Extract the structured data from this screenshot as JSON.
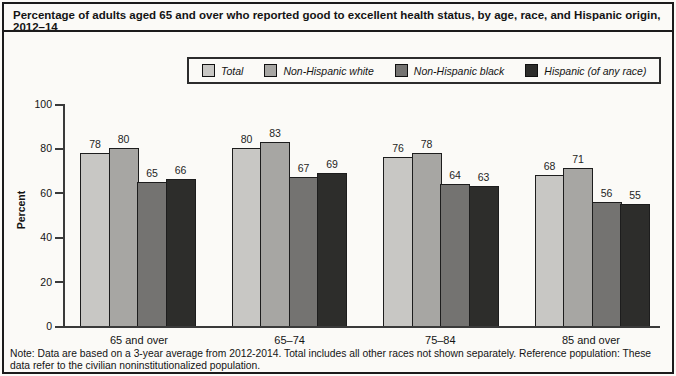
{
  "title": "Percentage of adults aged 65 and over who reported good to excellent health status, by age, race, and Hispanic origin, 2012–14",
  "note": "Note: Data are based on a 3-year average from 2012-2014. Total includes all other races not shown separately. Reference population: These data refer to the civilian noninstitutionalized population.",
  "chart_data": {
    "type": "bar",
    "title": "Percentage of adults aged 65 and over who reported good to excellent health status, by age, race, and Hispanic origin, 2012–14",
    "xlabel": "",
    "ylabel": "Percent",
    "ylim": [
      0,
      100
    ],
    "yticks": [
      0,
      20,
      40,
      60,
      80,
      100
    ],
    "grid": false,
    "legend_position": "top-center",
    "categories": [
      "65 and over",
      "65–74",
      "75–84",
      "85 and over"
    ],
    "series": [
      {
        "name": "Total",
        "color": "#c8c7c4",
        "values": [
          78,
          80,
          76,
          68
        ]
      },
      {
        "name": "Non-Hispanic white",
        "color": "#a7a6a3",
        "values": [
          80,
          83,
          78,
          71
        ]
      },
      {
        "name": "Non-Hispanic black",
        "color": "#747371",
        "values": [
          65,
          67,
          64,
          56
        ]
      },
      {
        "name": "Hispanic (of any race)",
        "color": "#2d2d2b",
        "values": [
          66,
          69,
          63,
          55
        ]
      }
    ],
    "bar_value_labels_shown": true
  }
}
